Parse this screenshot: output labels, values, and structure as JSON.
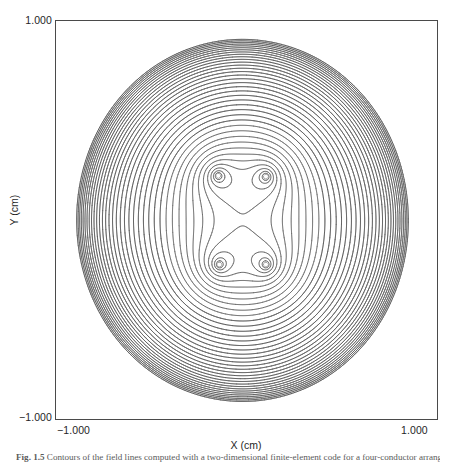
{
  "figure": {
    "caption_label": "Fig. 1.5",
    "caption_text": "Contours of the field lines computed with a two-dimensional finite-element code for a four-conductor arrangement."
  },
  "axes": {
    "x_title": "X (cm)",
    "y_title": "Y (cm)",
    "x_ticks": [
      "−1.000",
      "1.000"
    ],
    "y_ticks": [
      "1.000",
      "−1.000"
    ],
    "x_tick_left": "−1.000",
    "x_tick_right": "1.000",
    "y_tick_top": "1.000",
    "y_tick_bottom": "−1.000",
    "frame_color": "#4a4a4a",
    "contour_color": "#555555"
  },
  "chart_data": {
    "type": "line",
    "plot_kind": "contour",
    "title": "",
    "xlabel": "X (cm)",
    "ylabel": "Y (cm)",
    "xlim": [
      -1.0,
      1.0
    ],
    "ylim": [
      -1.0,
      1.0
    ],
    "xticks": [
      -1.0,
      1.0
    ],
    "yticks": [
      -1.0,
      1.0
    ],
    "xticklabels": [
      "-1.000",
      "1.000"
    ],
    "yticklabels": [
      "-1.000",
      "1.000"
    ],
    "grid": false,
    "legend": false,
    "sources": [
      {
        "name": "conductor-top-left",
        "x": -0.148,
        "y": 0.222,
        "strength": 1.0
      },
      {
        "name": "conductor-top-right",
        "x": 0.102,
        "y": 0.218,
        "strength": 1.0
      },
      {
        "name": "conductor-bottom-left",
        "x": -0.142,
        "y": -0.224,
        "strength": 1.0
      },
      {
        "name": "conductor-bottom-right",
        "x": 0.102,
        "y": -0.224,
        "strength": 1.0
      }
    ],
    "n_levels": 46,
    "level_scaling": "geometric",
    "level_min": 0.42,
    "level_max": 14.0,
    "series": [
      {
        "name": "equipotential contours",
        "values": []
      }
    ]
  }
}
